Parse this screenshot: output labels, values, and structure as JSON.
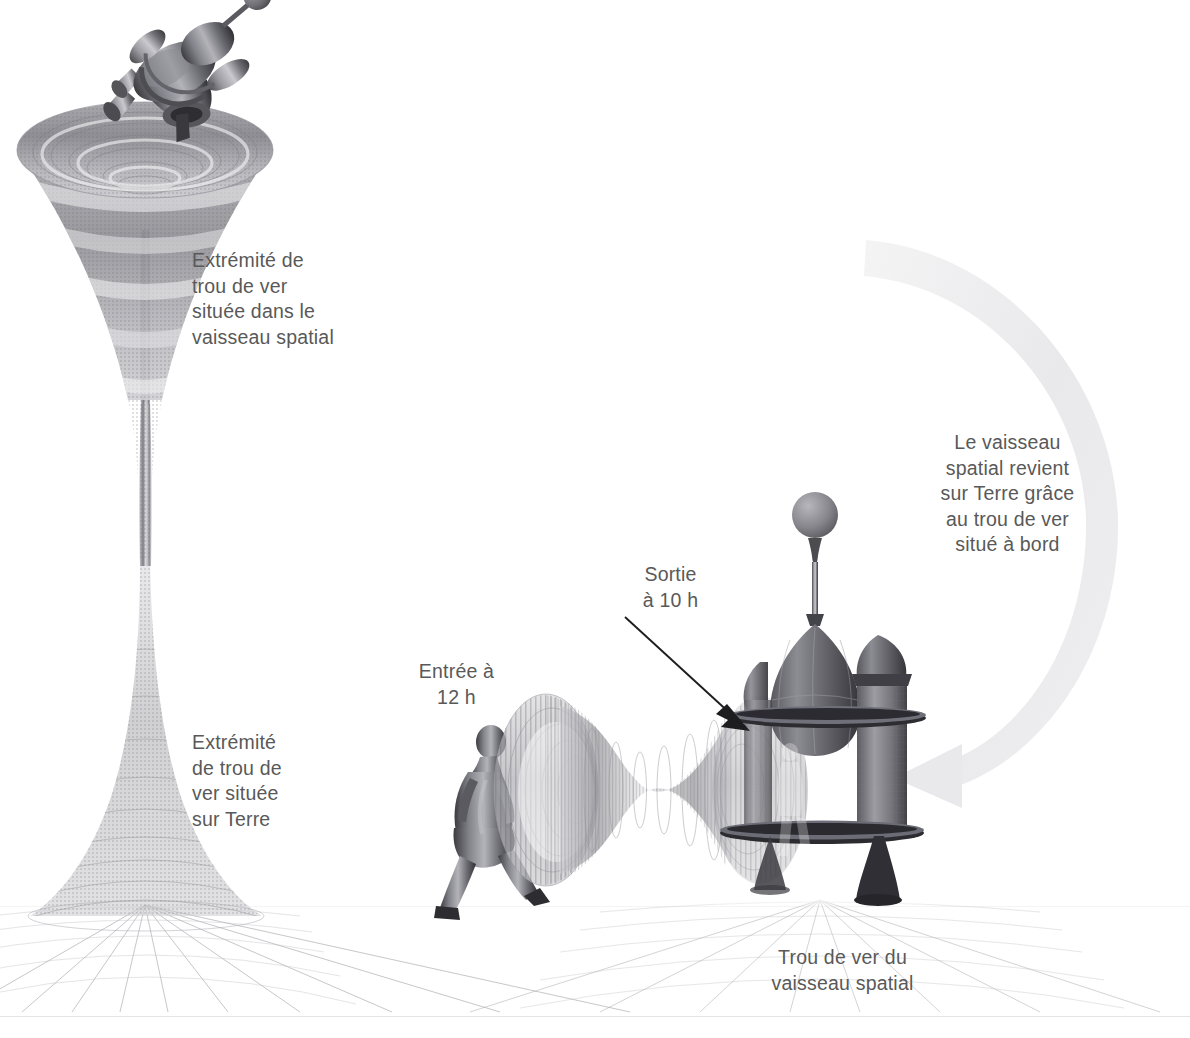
{
  "figure": {
    "language": "fr",
    "background_color": "#ffffff",
    "text_color": "#595959",
    "arrow_color": "#eeeeee",
    "pointer_arrow_color": "#1a1a1a",
    "grid_color": "#b9b9bf"
  },
  "labels": {
    "wormhole_end_ship": "Extrémité de\ntrou de ver\nsituée dans le\nvaisseau spatial",
    "wormhole_end_earth": "Extrémité\nde trou de\nver située\nsur Terre",
    "entry": "Entrée à\n12 h",
    "exit": "Sortie\nà 10 h",
    "return_note": "Le vaisseau\nspatial revient\nsur Terre grâce\nau trou de ver\nsitué à bord",
    "ship_wormhole": "Trou de ver du\nvaisseau spatial"
  },
  "objects": {
    "spacecraft_top": "spacecraft-icon",
    "vertical_wormhole": "wormhole-funnel-icon",
    "walking_person": "person-walking-icon",
    "horizontal_wormhole": "wormhole-tube-icon",
    "space_station": "domed-station-icon",
    "station_sphere": "sphere-icon",
    "ground_grid": "spacetime-grid-icon",
    "return_arrow": "curved-arrow-icon",
    "exit_pointer": "pointer-arrow-icon"
  },
  "times": {
    "entry_hour": "12 h",
    "exit_hour": "10 h"
  }
}
